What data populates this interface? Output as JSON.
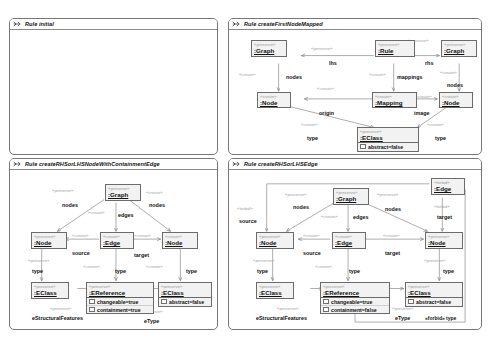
{
  "document": {
    "type": "graph-transformation-rule-diagrams",
    "panel_count": 4
  },
  "stereotypes": {
    "preserve": "«preserve»",
    "create": "«create»",
    "forbid": "«forbid»"
  },
  "panels": [
    {
      "id": "rule-initial",
      "title": "Rule initial",
      "icon": "rule-arrow-icon",
      "empty": true,
      "nodes": [],
      "edge_labels": []
    },
    {
      "id": "rule-create-first-node-mapped",
      "title": "Rule createFirstNodeMapped",
      "icon": "rule-arrow-icon",
      "empty": false,
      "nodes": [
        {
          "name": ":Graph",
          "stereotype": "«preserve»",
          "attributes": []
        },
        {
          "name": ":Rule",
          "stereotype": "«preserve»",
          "attributes": []
        },
        {
          "name": ":Graph",
          "stereotype": "«preserve»",
          "attributes": []
        },
        {
          "name": ":Node",
          "stereotype": "«create»",
          "attributes": []
        },
        {
          "name": ":Mapping",
          "stereotype": "«create»",
          "attributes": []
        },
        {
          "name": ":Node",
          "stereotype": "«create»",
          "attributes": []
        },
        {
          "name": ":EClass",
          "stereotype": "«preserve»",
          "attributes": [
            "abstract=false"
          ]
        }
      ],
      "edge_labels": [
        "lhs",
        "rhs",
        "mappings",
        "nodes",
        "nodes",
        "origin",
        "image",
        "type",
        "type"
      ]
    },
    {
      "id": "rule-create-rhs-or-lhs-node-with-containment-edge",
      "title": "Rule createRHSorLHSNodeWithContainmentEdge",
      "icon": "rule-arrow-icon",
      "empty": false,
      "nodes": [
        {
          "name": ":Graph",
          "stereotype": "«preserve»",
          "attributes": []
        },
        {
          "name": ":Node",
          "stereotype": "«preserve»",
          "attributes": []
        },
        {
          "name": ":Edge",
          "stereotype": "«create»",
          "attributes": []
        },
        {
          "name": ":Node",
          "stereotype": "«create»",
          "attributes": []
        },
        {
          "name": ":EClass",
          "stereotype": "«preserve»",
          "attributes": []
        },
        {
          "name": ":EReference",
          "stereotype": "«preserve»",
          "attributes": [
            "changeable=true",
            "containment=true"
          ]
        },
        {
          "name": ":EClass",
          "stereotype": "«preserve»",
          "attributes": [
            "abstract=false"
          ]
        }
      ],
      "edge_labels": [
        "nodes",
        "nodes",
        "edges",
        "source",
        "target",
        "type",
        "type",
        "type",
        "eStructuralFeatures",
        "eType"
      ]
    },
    {
      "id": "rule-create-rhs-or-lhs-edge",
      "title": "Rule createRHSorLHSEdge",
      "icon": "rule-arrow-icon",
      "empty": false,
      "nodes": [
        {
          "name": ":Edge",
          "stereotype": "«forbid»",
          "attributes": []
        },
        {
          "name": ":Graph",
          "stereotype": "«preserve»",
          "attributes": []
        },
        {
          "name": ":Node",
          "stereotype": "«preserve»",
          "attributes": []
        },
        {
          "name": ":Edge",
          "stereotype": "«create»",
          "attributes": []
        },
        {
          "name": ":Node",
          "stereotype": "«preserve»",
          "attributes": []
        },
        {
          "name": ":EClass",
          "stereotype": "«preserve»",
          "attributes": []
        },
        {
          "name": ":EReference",
          "stereotype": "«preserve»",
          "attributes": [
            "changeable=true",
            "containment=false"
          ]
        },
        {
          "name": ":EClass",
          "stereotype": "«preserve»",
          "attributes": [
            "abstract=false"
          ]
        }
      ],
      "edge_labels": [
        "source",
        "nodes",
        "nodes",
        "edges",
        "target",
        "source",
        "target",
        "type",
        "type",
        "type",
        "eStructuralFeatures",
        "eType",
        "«forbid» type"
      ]
    }
  ],
  "p2": {
    "n_graph_l": {
      "st": "«preserve»",
      "name": ":Graph"
    },
    "n_rule": {
      "st": "«preserve»",
      "name": ":Rule"
    },
    "n_graph_r": {
      "st": "«preserve»",
      "name": ":Graph"
    },
    "n_node_l": {
      "st": "«create»",
      "name": ":Node"
    },
    "n_map": {
      "st": "«create»",
      "name": ":Mapping"
    },
    "n_node_r": {
      "st": "«create»",
      "name": ":Node"
    },
    "n_eclass": {
      "st": "«preserve»",
      "name": ":EClass",
      "a1": "abstract=false"
    },
    "e_lhs": "lhs",
    "e_rhs": "rhs",
    "e_mappings": "mappings",
    "e_nodes_l": "nodes",
    "e_nodes_r": "nodes",
    "e_origin": "origin",
    "e_image": "image",
    "e_type_l": "type",
    "e_type_r": "type",
    "s_pres_lhs": "«preserve»",
    "s_pres_rhs": "«preserve»",
    "s_cre_map": "«create»",
    "s_cre_nodes_l": "«create»",
    "s_cre_nodes_r": "«create»",
    "s_cre_origin": "«create»",
    "s_cre_image": "«create»",
    "s_cre_type_l": "«create»",
    "s_cre_type_r": "«create»"
  },
  "p3": {
    "n_graph": {
      "st": "«preserve»",
      "name": ":Graph"
    },
    "n_node_l": {
      "st": "«preserve»",
      "name": ":Node"
    },
    "n_edge": {
      "st": "«create»",
      "name": ":Edge"
    },
    "n_node_r": {
      "st": "«create»",
      "name": ":Node"
    },
    "n_eclass_l": {
      "st": "«preserve»",
      "name": ":EClass"
    },
    "n_eref": {
      "st": "«preserve»",
      "name": ":EReference",
      "a1": "changeable=true",
      "a2": "containment=true"
    },
    "n_eclass_r": {
      "st": "«preserve»",
      "name": ":EClass",
      "a1": "abstract=false"
    },
    "e_nodes_l": "nodes",
    "e_nodes_r": "nodes",
    "e_edges": "edges",
    "e_source": "source",
    "e_target": "target",
    "e_type_l": "type",
    "e_type_m": "type",
    "e_type_r": "type",
    "e_esf": "eStructuralFeatures",
    "e_etype": "eType",
    "s_pres_nodes_l": "«preserve»",
    "s_cre_nodes_r": "«create»",
    "s_cre_edges": "«create»",
    "s_cre_source": "«create»",
    "s_cre_target": "«create»",
    "s_pres_type_l": "«preserve»",
    "s_cre_type_m": "«create»",
    "s_cre_type_r": "«create»",
    "s_pres_esf": "«preserve»",
    "s_pres_etype": "«preserve»"
  },
  "p4": {
    "n_edge_f": {
      "st": "«forbid»",
      "name": ":Edge"
    },
    "n_graph": {
      "st": "«preserve»",
      "name": ":Graph"
    },
    "n_node_l": {
      "st": "«preserve»",
      "name": ":Node"
    },
    "n_edge": {
      "st": "«create»",
      "name": ":Edge"
    },
    "n_node_r": {
      "st": "«preserve»",
      "name": ":Node"
    },
    "n_eclass_l": {
      "st": "«preserve»",
      "name": ":EClass"
    },
    "n_eref": {
      "st": "«preserve»",
      "name": ":EReference",
      "a1": "changeable=true",
      "a2": "containment=false"
    },
    "n_eclass_r": {
      "st": "«preserve»",
      "name": ":EClass",
      "a1": "abstract=false"
    },
    "e_fsource": "source",
    "e_ftarget": "target",
    "e_nodes_l": "nodes",
    "e_nodes_r": "nodes",
    "e_edges": "edges",
    "e_source": "source",
    "e_target": "target",
    "e_type_l": "type",
    "e_type_m": "type",
    "e_type_r": "type",
    "e_esf": "eStructuralFeatures",
    "e_etype": "eType",
    "e_ftype": "«forbid» type",
    "s_forbid_source": "«forbid»",
    "s_forbid_target": "«forbid»",
    "s_pres_nodes_l": "«preserve»",
    "s_pres_nodes_r": "«preserve»",
    "s_cre_edges": "«create»",
    "s_cre_source": "«create»",
    "s_cre_target": "«create»",
    "s_pres_type_l": "«preserve»",
    "s_cre_type_m": "«create»",
    "s_pres_type_r": "«preserve»",
    "s_pres_esf": "«preserve»",
    "s_pres_etype": "«preserve»"
  },
  "colors": {
    "panel_border": "#777777",
    "node_fill": "#f2f2f2",
    "node_border": "#6b6b6b",
    "stereotype_text": "#9a9a9a",
    "wire": "#8a8a8a",
    "background": "#ffffff"
  }
}
